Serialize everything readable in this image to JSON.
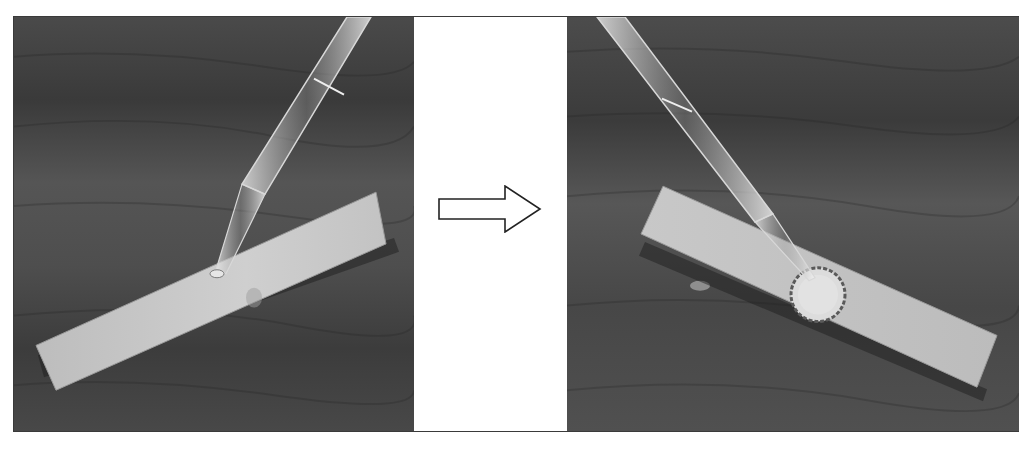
{
  "figure": {
    "panels": [
      {
        "id": "before",
        "caption": "",
        "content": "Glass dropper touching a pale paper strip lying on dark wood surface; small droplet at tip"
      },
      {
        "id": "after",
        "caption": "",
        "content": "Glass dropper above paper strip; a circular wet spot with dark ragged ring has spread on the strip"
      }
    ],
    "transition": {
      "icon": "right-arrow-icon",
      "style": "outlined hollow arrow"
    }
  },
  "colors": {
    "background": "#ffffff",
    "frame_border": "#3a3a3a",
    "wood_dark": "#3c3c3c",
    "wood_mid": "#5a5a5a",
    "strip": "#c9c9c9",
    "arrow_stroke": "#222222"
  }
}
